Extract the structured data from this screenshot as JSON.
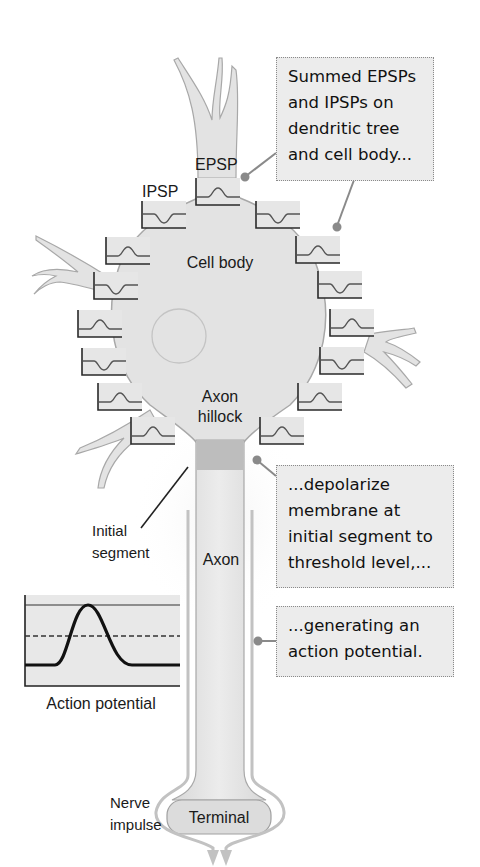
{
  "labels": {
    "epsp": "EPSP",
    "ipsp": "IPSP",
    "cell_body": "Cell body",
    "axon_hillock_line1": "Axon",
    "axon_hillock_line2": "hillock",
    "initial_segment_line1": "Initial",
    "initial_segment_line2": "segment",
    "axon": "Axon",
    "terminal": "Terminal",
    "nerve_impulse_line1": "Nerve",
    "nerve_impulse_line2": "impulse",
    "action_potential": "Action potential"
  },
  "callouts": [
    {
      "id": "summed",
      "lines": [
        "Summed EPSPs",
        "and IPSPs on",
        "dendritic tree",
        "and cell body..."
      ]
    },
    {
      "id": "depolarize",
      "lines": [
        "...depolarize",
        "membrane at",
        "initial segment to",
        "threshold level,..."
      ]
    },
    {
      "id": "generating",
      "lines": [
        "...generating an",
        "action potential."
      ]
    }
  ],
  "synapse_insets": {
    "left": [
      "EPSP",
      "IPSP",
      "EPSP",
      "IPSP",
      "EPSP",
      "EPSP"
    ],
    "right": [
      "IPSP",
      "EPSP",
      "IPSP",
      "EPSP",
      "IPSP",
      "EPSP",
      "EPSP"
    ],
    "top_epsp": "EPSP",
    "top_ipsp": "IPSP"
  },
  "colors": {
    "cell_fill": "#e3e3e3",
    "cell_outline": "#a8a8a8",
    "initial_segment": "#bdbdbd",
    "callout_bg": "#ececec",
    "inset_bg": "#e6e6e6",
    "line": "#333333"
  }
}
